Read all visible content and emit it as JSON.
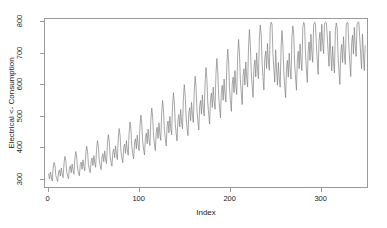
{
  "chart_data": {
    "type": "line",
    "title": "",
    "xlabel": "Index",
    "ylabel": "Electrical <- Consumption",
    "xlim": [
      -4,
      352
    ],
    "ylim": [
      270,
      810
    ],
    "grid": false,
    "legend": null,
    "line_color": "#808080",
    "x_ticks": [
      0,
      100,
      200,
      300
    ],
    "y_ticks": [
      300,
      400,
      500,
      600,
      700,
      800
    ],
    "x_tick_labels": [
      "0",
      "100",
      "200",
      "300"
    ],
    "y_tick_labels": [
      "300",
      "400",
      "500",
      "600",
      "700",
      "800"
    ],
    "series": [
      {
        "name": "Electrical Consumption",
        "values": [
          312,
          296,
          318,
          302,
          289,
          330,
          349,
          340,
          306,
          297,
          288,
          318,
          325,
          305,
          331,
          312,
          300,
          345,
          368,
          356,
          318,
          305,
          297,
          330,
          338,
          316,
          344,
          324,
          311,
          360,
          384,
          370,
          330,
          316,
          306,
          342,
          350,
          327,
          357,
          335,
          322,
          375,
          401,
          385,
          342,
          327,
          316,
          354,
          363,
          339,
          371,
          347,
          333,
          391,
          419,
          401,
          355,
          338,
          326,
          367,
          377,
          351,
          386,
          360,
          345,
          408,
          438,
          418,
          369,
          350,
          337,
          381,
          392,
          364,
          402,
          374,
          358,
          426,
          458,
          436,
          384,
          363,
          348,
          396,
          408,
          378,
          419,
          389,
          372,
          445,
          479,
          455,
          400,
          377,
          360,
          412,
          425,
          393,
          437,
          405,
          387,
          465,
          501,
          475,
          417,
          392,
          373,
          429,
          443,
          409,
          456,
          422,
          403,
          486,
          524,
          496,
          435,
          408,
          387,
          447,
          462,
          426,
          476,
          440,
          420,
          508,
          548,
          518,
          454,
          425,
          402,
          466,
          482,
          444,
          497,
          459,
          438,
          531,
          573,
          541,
          474,
          443,
          418,
          486,
          503,
          463,
          519,
          479,
          457,
          555,
          599,
          565,
          495,
          462,
          435,
          507,
          525,
          483,
          542,
          500,
          477,
          580,
          626,
          590,
          517,
          482,
          453,
          529,
          548,
          504,
          566,
          522,
          498,
          606,
          654,
          616,
          540,
          503,
          472,
          552,
          572,
          526,
          591,
          545,
          520,
          633,
          683,
          643,
          564,
          525,
          492,
          576,
          597,
          549,
          617,
          569,
          543,
          661,
          713,
          671,
          589,
          548,
          513,
          601,
          623,
          573,
          644,
          594,
          567,
          690,
          744,
          700,
          615,
          572,
          535,
          627,
          650,
          598,
          672,
          620,
          592,
          720,
          776,
          730,
          642,
          597,
          558,
          654,
          678,
          624,
          701,
          647,
          618,
          751,
          790,
          761,
          670,
          623,
          582,
          682,
          707,
          651,
          731,
          675,
          645,
          783,
          800,
          793,
          699,
          650,
          607,
          711,
          648,
          597,
          670,
          619,
          591,
          718,
          773,
          727,
          641,
          596,
          557,
          652,
          677,
          623,
          700,
          646,
          617,
          750,
          788,
          760,
          669,
          622,
          581,
          681,
          706,
          650,
          730,
          674,
          644,
          782,
          799,
          792,
          698,
          649,
          606,
          710,
          736,
          677,
          761,
          703,
          671,
          790,
          800,
          795,
          728,
          677,
          632,
          740,
          767,
          706,
          793,
          732,
          699,
          795,
          800,
          798,
          758,
          705,
          658,
          771,
          699,
          643,
          722,
          667,
          637,
          773,
          797,
          783,
          691,
          643,
          600,
          703,
          728,
          670,
          753,
          695,
          664,
          789,
          800,
          797,
          720,
          669,
          625,
          732,
          758,
          697,
          783,
          723,
          690,
          793,
          800,
          799,
          749,
          697,
          650,
          762,
          700,
          644,
          724
        ]
      }
    ]
  }
}
